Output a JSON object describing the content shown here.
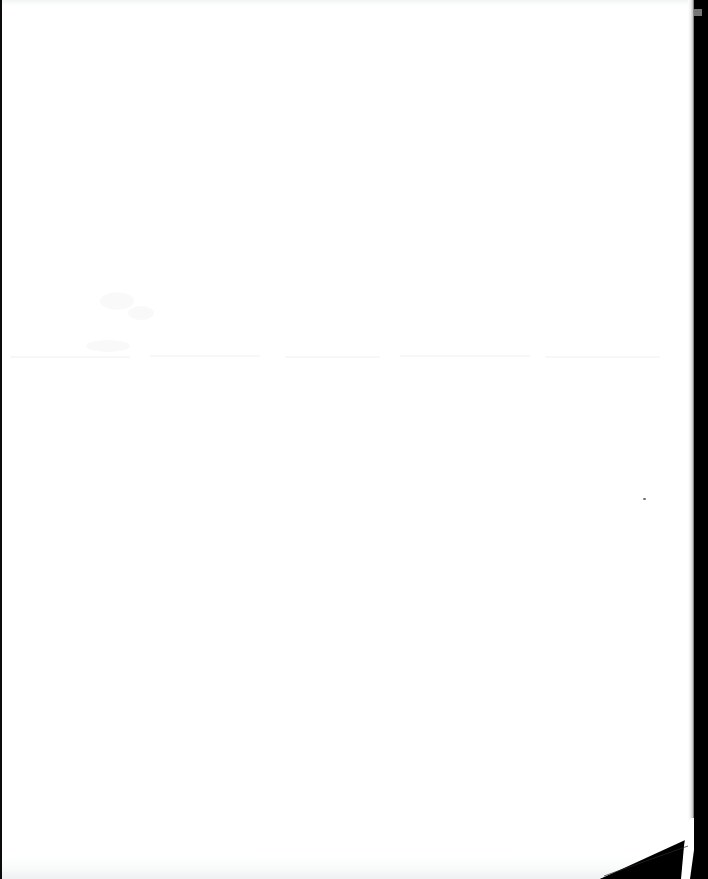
{
  "document": {
    "kind": "scanned-page",
    "title": "Blank scanned page",
    "page_width": 708,
    "page_height": 879,
    "background_color": "#ffffff",
    "body_text": "",
    "visible_text_count": 0,
    "description": "Blank white scanned sheet with dark scanner background at the right edge and a curled dark corner at the bottom right."
  },
  "paper": {
    "sheet_color": "#ffffff",
    "sheet_width": 694,
    "sheet_height": 879,
    "top_edge_tone": "#f2f3f4",
    "bottom_edge_tone": "#eef0f1"
  },
  "scanner_void": {
    "label": "scanner-background",
    "color": "#000000",
    "right_band_x": 694,
    "right_band_width": 14,
    "left_strip_color": "#0b0b0b",
    "left_strip_width": 2,
    "falloff_color": "#c9c9c9",
    "notch_color": "#8a8a8a",
    "notch_y": 9
  },
  "corner_curl": {
    "label": "dog-eared-corner",
    "color": "#000000",
    "origin_x": 600,
    "origin_y": 879,
    "apex_x": 694,
    "apex_y": 838,
    "notch_label": "white-sliver-notch",
    "notch_color": "#ffffff",
    "notch_x": 682,
    "notch_y": 820
  },
  "artifacts": {
    "label": "scan-bleed-through",
    "bands": [
      {
        "name": "faint-line-left",
        "x": 10,
        "y": 356,
        "width": 120,
        "opacity": 0.03
      },
      {
        "name": "faint-line-midleft",
        "x": 150,
        "y": 355,
        "width": 110,
        "opacity": 0.03
      },
      {
        "name": "faint-line-center",
        "x": 285,
        "y": 356,
        "width": 95,
        "opacity": 0.03
      },
      {
        "name": "faint-line-midright",
        "x": 400,
        "y": 355,
        "width": 130,
        "opacity": 0.03
      },
      {
        "name": "faint-line-right",
        "x": 545,
        "y": 356,
        "width": 115,
        "opacity": 0.03
      }
    ],
    "smudges": [
      {
        "name": "smudge-upper-left",
        "x": 100,
        "y": 292,
        "width": 34,
        "height": 18
      },
      {
        "name": "smudge-upper-mid",
        "x": 128,
        "y": 306,
        "width": 26,
        "height": 14
      },
      {
        "name": "smudge-left-low",
        "x": 86,
        "y": 340,
        "width": 44,
        "height": 12
      }
    ],
    "specks": [
      {
        "name": "speck-right-mid",
        "x": 643,
        "y": 498,
        "width": 3,
        "height": 2
      }
    ]
  }
}
